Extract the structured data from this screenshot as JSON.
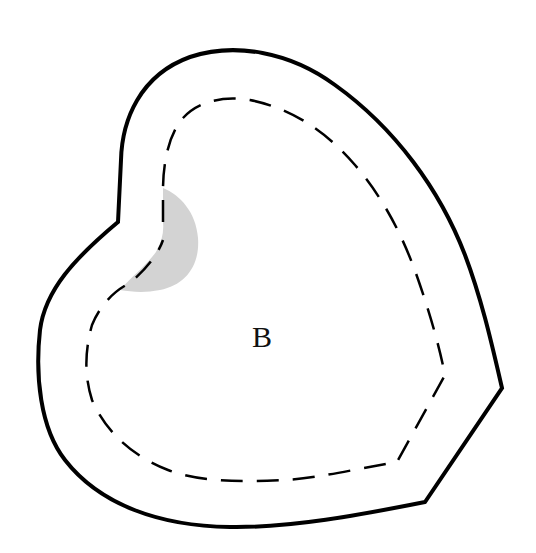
{
  "diagram": {
    "region_label": "B",
    "colors": {
      "outline": "#000000",
      "dashed_outline": "#000000",
      "shaded_region": "#d3d3d3",
      "background": "#ffffff",
      "label": "#111111"
    },
    "elements": {
      "outer_boundary": "solid heart-shaped outline",
      "inner_boundary": "dashed inner outline",
      "shaded_area": "grey crescent near top-left notch"
    }
  }
}
